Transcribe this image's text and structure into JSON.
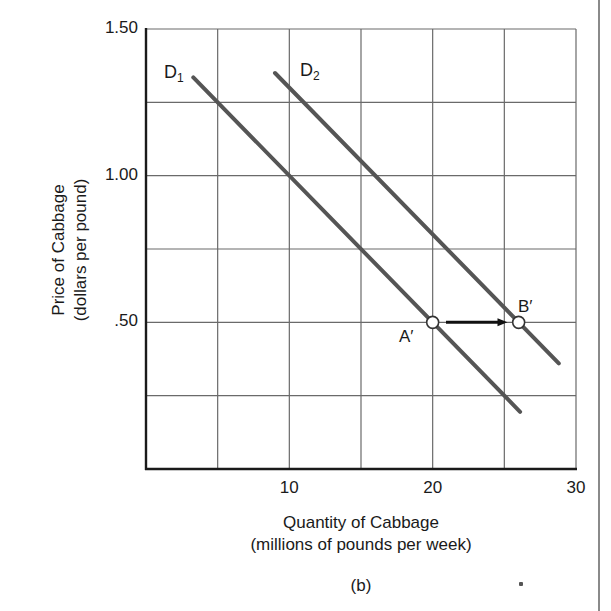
{
  "chart_data": {
    "type": "line",
    "title": "",
    "caption": "(b)",
    "xlabel": "Quantity of Cabbage",
    "xlabel_sub": "(millions of pounds per week)",
    "ylabel": "Price of Cabbage",
    "ylabel_sub": "(dollars per pound)",
    "xlim": [
      0,
      30
    ],
    "ylim": [
      0,
      1.5
    ],
    "x_ticks": [
      10,
      20,
      30
    ],
    "x_tick_labels": [
      "10",
      "20",
      "30"
    ],
    "y_ticks": [
      0.5,
      1.0,
      1.5
    ],
    "y_tick_labels": [
      ".50",
      "1.00",
      "1.50"
    ],
    "grid": {
      "on": true,
      "x_step": 5,
      "y_step": 0.25
    },
    "series": [
      {
        "name": "D1",
        "label_main": "D",
        "label_sub": "1",
        "points": [
          [
            3.3,
            1.335
          ],
          [
            26.1,
            0.195
          ]
        ],
        "equation": "P = 1.50 - 0.05Q",
        "color": "#555555"
      },
      {
        "name": "D2",
        "label_main": "D",
        "label_sub": "2",
        "points": [
          [
            9.0,
            1.35
          ],
          [
            28.8,
            0.36
          ]
        ],
        "equation": "P = 1.80 - 0.05Q",
        "color": "#555555"
      }
    ],
    "annotations": [
      {
        "label": "A′",
        "x": 20,
        "y": 0.5,
        "type": "point"
      },
      {
        "label": "B′",
        "x": 26,
        "y": 0.5,
        "type": "point"
      },
      {
        "type": "arrow",
        "from": [
          21,
          0.5
        ],
        "to": [
          25.5,
          0.5
        ],
        "description": "shift from A′ to B′"
      }
    ]
  }
}
